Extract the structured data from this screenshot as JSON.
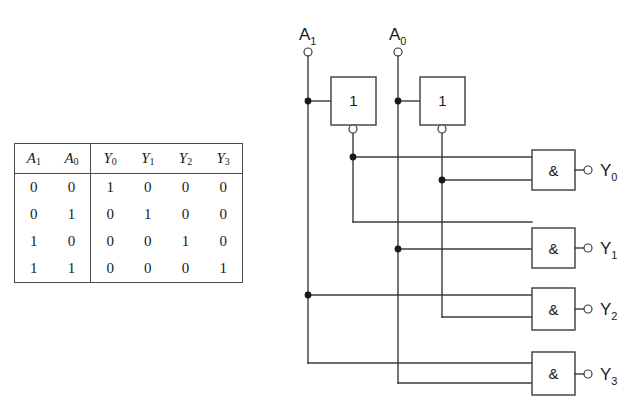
{
  "figure": {
    "background_color": "#ffffff",
    "line_color": "#3c3c3c",
    "text_color": "#1a1a1a"
  },
  "truth_table": {
    "headers": [
      "A",
      "A",
      "Y",
      "Y",
      "Y",
      "Y"
    ],
    "header_subs": [
      "1",
      "0",
      "0",
      "1",
      "2",
      "3"
    ],
    "rows": [
      [
        "0",
        "0",
        "1",
        "0",
        "0",
        "0"
      ],
      [
        "0",
        "1",
        "0",
        "1",
        "0",
        "0"
      ],
      [
        "1",
        "0",
        "0",
        "0",
        "1",
        "0"
      ],
      [
        "1",
        "1",
        "0",
        "0",
        "0",
        "1"
      ]
    ]
  },
  "circuit": {
    "inputs": [
      {
        "name": "A",
        "sub": "1",
        "label_x": 299,
        "label_y": 40,
        "terminal_x": 308,
        "terminal_y": 52
      },
      {
        "name": "A",
        "sub": "0",
        "label_x": 389,
        "label_y": 40,
        "terminal_x": 398,
        "terminal_y": 52
      }
    ],
    "inverters": [
      {
        "label": "1",
        "x": 331,
        "y": 77,
        "w": 45,
        "h": 48
      },
      {
        "label": "1",
        "x": 420,
        "y": 77,
        "w": 45,
        "h": 48
      }
    ],
    "and_gates": [
      {
        "label": "&",
        "x": 532,
        "y": 150,
        "w": 43,
        "h": 40,
        "out_name": "Y",
        "out_sub": "0"
      },
      {
        "label": "&",
        "x": 532,
        "y": 228,
        "w": 43,
        "h": 40,
        "out_name": "Y",
        "out_sub": "1"
      },
      {
        "label": "&",
        "x": 532,
        "y": 288,
        "w": 43,
        "h": 42,
        "out_name": "Y",
        "out_sub": "2"
      },
      {
        "label": "&",
        "x": 532,
        "y": 352,
        "w": 43,
        "h": 43,
        "out_name": "Y",
        "out_sub": "3"
      }
    ],
    "outputs": [
      {
        "name": "Y",
        "sub": "0",
        "label_x": 600,
        "label_y": 176
      },
      {
        "name": "Y",
        "sub": "1",
        "label_x": 600,
        "label_y": 254
      },
      {
        "name": "Y",
        "sub": "2",
        "label_x": 600,
        "label_y": 315
      },
      {
        "name": "Y",
        "sub": "3",
        "label_x": 600,
        "label_y": 380
      }
    ]
  }
}
